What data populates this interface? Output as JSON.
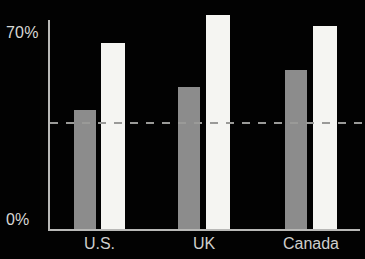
{
  "chart_data": {
    "type": "bar",
    "title": "",
    "subtitle": "",
    "xlabel": "",
    "ylabel": "",
    "categories": [
      "U.S.",
      "UK",
      "Canada"
    ],
    "series": [
      {
        "name": "gray-series",
        "color": "#8c8c8c",
        "values": [
          44.5,
          53.0,
          59.5
        ]
      },
      {
        "name": "white-series",
        "color": "#f5f5f2",
        "values": [
          69.5,
          80.0,
          76.0
        ]
      }
    ],
    "ylim": [
      0,
      70
    ],
    "yticks": [
      0,
      70
    ],
    "ytick_labels": [
      "0%",
      "70%"
    ],
    "grid": false,
    "legend": "none",
    "annotations": [
      {
        "type": "reference-line",
        "style": "dashed",
        "value": 40,
        "color": "#9a9a98"
      }
    ],
    "background_color": "#020202",
    "axis_color": "#b9b9b7",
    "text_color": "#d8d8d6"
  },
  "axis": {
    "top_tick": "70%",
    "bottom_tick": "0%"
  },
  "categories": {
    "first": "U.S.",
    "second": "UK",
    "third": "Canada"
  }
}
